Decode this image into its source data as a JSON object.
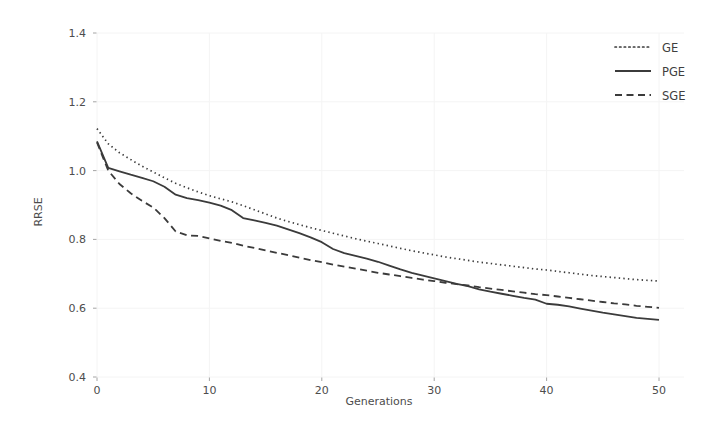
{
  "chart_data": {
    "type": "line",
    "title": "",
    "xlabel": "Generations",
    "ylabel": "RRSE",
    "xlim": [
      0,
      50
    ],
    "ylim": [
      0.4,
      1.4
    ],
    "xticks": [
      "0",
      "10",
      "20",
      "30",
      "40",
      "50"
    ],
    "xtick_values": [
      0,
      10,
      20,
      30,
      40,
      50
    ],
    "yticks": [
      "0.4",
      "0.6",
      "0.8",
      "1.0",
      "1.2",
      "1.4"
    ],
    "ytick_values": [
      0.4,
      0.6,
      0.8,
      1.0,
      1.2,
      1.4
    ],
    "grid": false,
    "legend_position": "upper right",
    "line_color": "#3b3b3b",
    "x": [
      0,
      1,
      2,
      3,
      4,
      5,
      6,
      7,
      8,
      9,
      10,
      11,
      12,
      13,
      14,
      15,
      16,
      17,
      18,
      19,
      20,
      21,
      22,
      23,
      24,
      25,
      26,
      27,
      28,
      29,
      30,
      31,
      32,
      33,
      34,
      35,
      36,
      37,
      38,
      39,
      40,
      41,
      42,
      43,
      44,
      45,
      46,
      47,
      48,
      49,
      50
    ],
    "series": [
      {
        "name": "GE",
        "style": "dotted",
        "values": [
          1.122,
          1.078,
          1.052,
          1.032,
          1.013,
          0.996,
          0.979,
          0.963,
          0.95,
          0.938,
          0.927,
          0.918,
          0.909,
          0.898,
          0.886,
          0.874,
          0.862,
          0.852,
          0.843,
          0.834,
          0.826,
          0.818,
          0.81,
          0.802,
          0.795,
          0.788,
          0.781,
          0.774,
          0.767,
          0.761,
          0.755,
          0.749,
          0.744,
          0.739,
          0.734,
          0.73,
          0.726,
          0.722,
          0.718,
          0.714,
          0.711,
          0.707,
          0.703,
          0.699,
          0.695,
          0.692,
          0.689,
          0.686,
          0.683,
          0.681,
          0.679
        ]
      },
      {
        "name": "PGE",
        "style": "solid",
        "values": [
          1.085,
          1.008,
          0.998,
          0.988,
          0.979,
          0.969,
          0.953,
          0.93,
          0.92,
          0.914,
          0.907,
          0.898,
          0.885,
          0.862,
          0.855,
          0.848,
          0.84,
          0.829,
          0.818,
          0.806,
          0.792,
          0.772,
          0.76,
          0.752,
          0.744,
          0.735,
          0.724,
          0.713,
          0.703,
          0.695,
          0.687,
          0.679,
          0.671,
          0.664,
          0.655,
          0.648,
          0.642,
          0.636,
          0.63,
          0.625,
          0.613,
          0.61,
          0.605,
          0.599,
          0.593,
          0.587,
          0.582,
          0.577,
          0.572,
          0.569,
          0.566
        ]
      },
      {
        "name": "SGE",
        "style": "dashed",
        "values": [
          1.082,
          1.0,
          0.961,
          0.934,
          0.912,
          0.893,
          0.862,
          0.823,
          0.812,
          0.81,
          0.803,
          0.796,
          0.79,
          0.782,
          0.775,
          0.768,
          0.761,
          0.754,
          0.747,
          0.74,
          0.734,
          0.727,
          0.721,
          0.715,
          0.709,
          0.703,
          0.698,
          0.693,
          0.688,
          0.683,
          0.679,
          0.674,
          0.67,
          0.666,
          0.661,
          0.657,
          0.653,
          0.649,
          0.645,
          0.641,
          0.638,
          0.634,
          0.63,
          0.626,
          0.622,
          0.618,
          0.614,
          0.611,
          0.607,
          0.604,
          0.601
        ]
      }
    ]
  },
  "legend": {
    "items": [
      {
        "label": "GE",
        "style": "dotted"
      },
      {
        "label": "PGE",
        "style": "solid"
      },
      {
        "label": "SGE",
        "style": "dashed"
      }
    ]
  }
}
